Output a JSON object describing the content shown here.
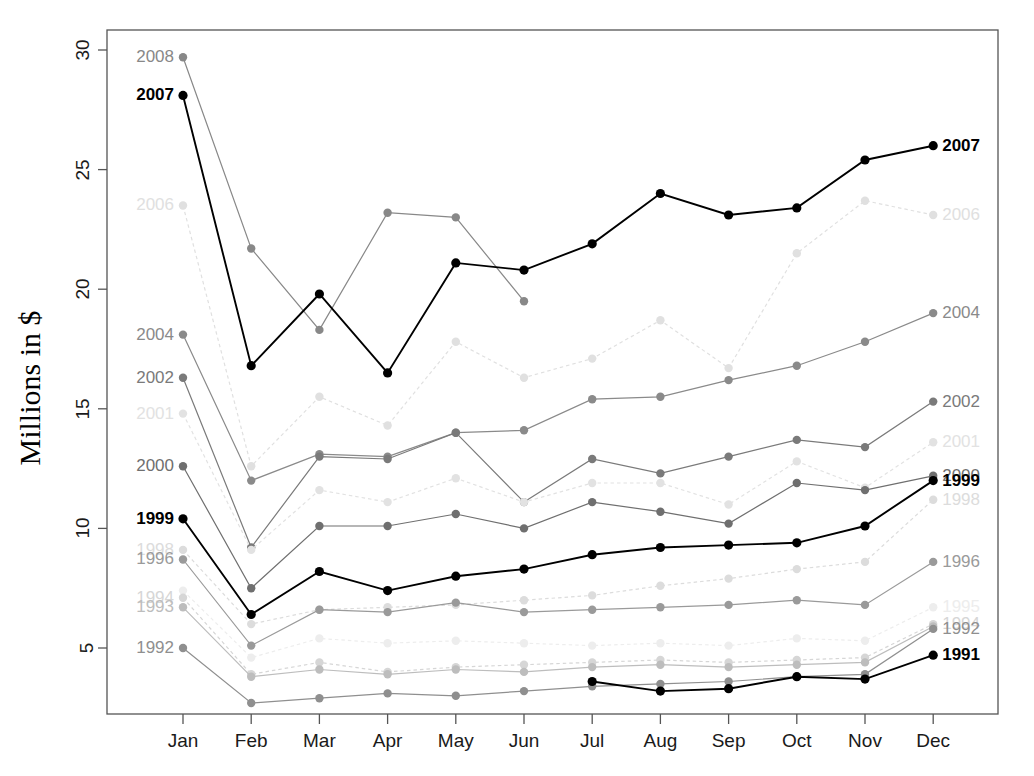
{
  "axes": {
    "ylabel": "Millions in $",
    "yticks": [
      30,
      25,
      20,
      15,
      10,
      5
    ],
    "xticks": [
      "Jan",
      "Feb",
      "Mar",
      "Apr",
      "May",
      "Jun",
      "Jul",
      "Aug",
      "Sep",
      "Oct",
      "Nov",
      "Dec"
    ]
  },
  "chart_data": {
    "type": "line",
    "title": "",
    "xlabel": "",
    "ylabel": "Millions in $",
    "ylim": [
      2.2,
      31.0
    ],
    "grid": false,
    "legend": "inline-endpoint-labels",
    "categories": [
      "Jan",
      "Feb",
      "Mar",
      "Apr",
      "May",
      "Jun",
      "Jul",
      "Aug",
      "Sep",
      "Oct",
      "Nov",
      "Dec"
    ],
    "series": [
      {
        "name": "2008",
        "color": "#888888",
        "style": "solid",
        "bold": false,
        "label_left": "2008",
        "label_right": "",
        "values": [
          29.7,
          21.7,
          18.3,
          23.2,
          23.0,
          19.5,
          null,
          null,
          null,
          null,
          null,
          null
        ]
      },
      {
        "name": "2007",
        "color": "#000000",
        "style": "solid",
        "bold": true,
        "label_left": "2007",
        "label_right": "2007",
        "values": [
          28.1,
          16.8,
          19.8,
          16.5,
          21.1,
          20.8,
          21.9,
          24.0,
          23.1,
          23.4,
          25.4,
          26.0
        ]
      },
      {
        "name": "2006",
        "color": "#e0e0e0",
        "style": "dotted",
        "bold": false,
        "label_left": "2006",
        "label_right": "2006",
        "values": [
          23.5,
          12.6,
          15.5,
          14.3,
          17.8,
          16.3,
          17.1,
          18.7,
          16.7,
          21.5,
          23.7,
          23.1
        ]
      },
      {
        "name": "2004",
        "color": "#8a8a8a",
        "style": "solid",
        "bold": false,
        "label_left": "2004",
        "label_right": "2004",
        "values": [
          18.1,
          12.0,
          13.1,
          13.0,
          14.0,
          14.1,
          15.4,
          15.5,
          16.2,
          16.8,
          17.8,
          19.0
        ]
      },
      {
        "name": "2002",
        "color": "#7a7a7a",
        "style": "solid",
        "bold": false,
        "label_left": "2002",
        "label_right": "2002",
        "values": [
          16.3,
          9.2,
          13.0,
          12.9,
          14.0,
          11.1,
          12.9,
          12.3,
          13.0,
          13.7,
          13.4,
          15.3
        ]
      },
      {
        "name": "2001",
        "color": "#e2e2e2",
        "style": "dotted",
        "bold": false,
        "label_left": "2001",
        "label_right": "2001",
        "values": [
          14.8,
          9.1,
          11.6,
          11.1,
          12.1,
          11.1,
          11.9,
          11.9,
          11.0,
          12.8,
          11.7,
          13.6
        ]
      },
      {
        "name": "2000",
        "color": "#6f6f6f",
        "style": "solid",
        "bold": false,
        "label_left": "2000",
        "label_right": "2000",
        "values": [
          12.6,
          7.5,
          10.1,
          10.1,
          10.6,
          10.0,
          11.1,
          10.7,
          10.2,
          11.9,
          11.6,
          12.2
        ]
      },
      {
        "name": "1999",
        "color": "#000000",
        "style": "solid",
        "bold": true,
        "label_left": "1999",
        "label_right": "1999",
        "values": [
          10.4,
          6.4,
          8.2,
          7.4,
          8.0,
          8.3,
          8.9,
          9.2,
          9.3,
          9.4,
          10.1,
          12.0
        ]
      },
      {
        "name": "1998",
        "color": "#dcdcdc",
        "style": "dotted",
        "bold": false,
        "label_left": "1998",
        "label_right": "1998",
        "values": [
          9.1,
          6.0,
          6.6,
          6.7,
          6.8,
          7.0,
          7.2,
          7.6,
          7.9,
          8.3,
          8.6,
          11.2
        ]
      },
      {
        "name": "1996",
        "color": "#9a9a9a",
        "style": "solid",
        "bold": false,
        "label_left": "1996",
        "label_right": "1996",
        "values": [
          8.7,
          5.1,
          6.6,
          6.5,
          6.9,
          6.5,
          6.6,
          6.7,
          6.8,
          7.0,
          6.8,
          8.6
        ]
      },
      {
        "name": "1995",
        "color": "#ededed",
        "style": "dotted",
        "bold": false,
        "label_left": "",
        "label_right": "1995",
        "values": [
          7.4,
          4.6,
          5.4,
          5.2,
          5.3,
          5.2,
          5.1,
          5.2,
          5.1,
          5.4,
          5.3,
          6.7
        ]
      },
      {
        "name": "1994",
        "color": "#d6d6d6",
        "style": "dotted",
        "bold": false,
        "label_left": "1994",
        "label_right": "1994",
        "values": [
          7.1,
          3.9,
          4.4,
          4.0,
          4.2,
          4.3,
          4.4,
          4.5,
          4.4,
          4.5,
          4.6,
          6.0
        ]
      },
      {
        "name": "1993",
        "color": "#bdbdbd",
        "style": "solid",
        "bold": false,
        "label_left": "1993",
        "label_right": "",
        "values": [
          6.7,
          3.8,
          4.1,
          3.9,
          4.1,
          4.0,
          4.2,
          4.3,
          4.2,
          4.3,
          4.4,
          5.9
        ]
      },
      {
        "name": "1992",
        "color": "#8f8f8f",
        "style": "solid",
        "bold": false,
        "label_left": "1992",
        "label_right": "1992",
        "values": [
          5.0,
          2.7,
          2.9,
          3.1,
          3.0,
          3.2,
          3.4,
          3.5,
          3.6,
          3.8,
          3.9,
          5.8
        ]
      },
      {
        "name": "1991",
        "color": "#000000",
        "style": "solid",
        "bold": true,
        "label_left": "",
        "label_right": "1991",
        "values": [
          null,
          null,
          null,
          null,
          null,
          null,
          3.6,
          3.2,
          3.3,
          3.8,
          3.7,
          4.7
        ]
      }
    ]
  },
  "plot": {
    "left": 107,
    "right": 998,
    "top": 30,
    "bottom": 714,
    "x_first": 183,
    "x_step": 68.2,
    "y_at_30": 50,
    "px_per_unit": 23.92
  }
}
